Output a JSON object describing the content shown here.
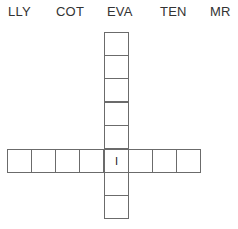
{
  "clues": [
    {
      "text": "LLY",
      "x": 8
    },
    {
      "text": "COT",
      "x": 56
    },
    {
      "text": "EVA",
      "x": 107
    },
    {
      "text": "TEN",
      "x": 160
    },
    {
      "text": "MR",
      "x": 210
    }
  ],
  "grid": {
    "line_color": "#6b6b6b",
    "vertical": {
      "x": 104,
      "top": 32,
      "cell_size": 23.4,
      "cells": [
        "",
        "",
        "",
        "",
        "",
        "I",
        "",
        ""
      ]
    },
    "horizontal": {
      "y": 149,
      "left": 7,
      "cell_size": 24.1,
      "cells": [
        "",
        "",
        "",
        "",
        "I",
        "",
        "",
        ""
      ],
      "intersection_index": 4
    }
  }
}
